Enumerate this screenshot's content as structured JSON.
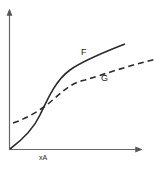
{
  "diagram": {
    "type": "curve-comparison",
    "curves": [
      {
        "name": "F",
        "style": "solid",
        "label": "F"
      },
      {
        "name": "G",
        "style": "dashed",
        "label": "G"
      }
    ],
    "x_axis_label": "xA",
    "y_axis_label": "",
    "colors": {
      "line": "#2a2a2a",
      "axis": "#555555"
    }
  }
}
